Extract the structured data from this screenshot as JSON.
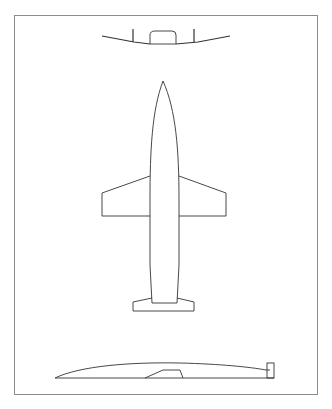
{
  "diagram": {
    "type": "aircraft-three-view",
    "views": [
      {
        "name": "front-view",
        "label": ""
      },
      {
        "name": "top-view",
        "label": ""
      },
      {
        "name": "side-view",
        "label": ""
      }
    ],
    "colors": {
      "line": "#333333",
      "frame": "#8c8c8c",
      "background": "#ffffff"
    }
  },
  "caption": ""
}
